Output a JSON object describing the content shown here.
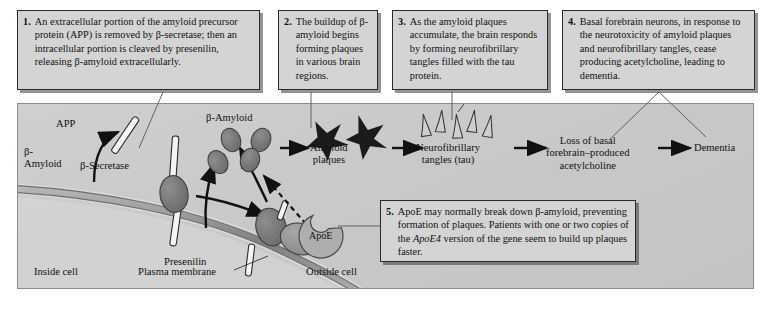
{
  "figure": {
    "background_color": "#c9c9c9",
    "box_fill": "#d4d4d4",
    "box_border": "#2a2a2a"
  },
  "callouts": [
    {
      "number": "1.",
      "text": "An extracellular portion of the amyloid precursor protein (APP) is removed by β-secretase; then an intracellular portion is cleaved by presenilin, releasing β-amyloid extracellularly."
    },
    {
      "number": "2.",
      "text": "The buildup of β-amyloid begins forming plaques in various brain regions."
    },
    {
      "number": "3.",
      "text": "As the amyloid plaques accumulate, the brain responds by forming neurofibrillary tangles filled with the tau protein."
    },
    {
      "number": "4.",
      "text": "Basal forebrain neurons, in response to the neurotoxicity of amyloid plaques and neurofibrillary tangles, cease producing acetylcholine, leading to dementia."
    },
    {
      "number": "5.",
      "text_part1": "ApoE may normally break down β-amyloid, preventing formation of plaques. Patients with one or two copies of the ",
      "italic": "ApoE4",
      "text_part2": " version of the gene seem to build up plaques faster."
    }
  ],
  "diagram_labels": {
    "app": "APP",
    "beta_amyloid_membrane": "β-\nAmyloid",
    "beta_amyloid_membrane_line1": "β-",
    "beta_amyloid_membrane_line2": "Amyloid",
    "beta_secretase": "β-Secretase",
    "beta_amyloid_cluster": "β-Amyloid",
    "presenilin": "Presenilin",
    "apoe": "ApoE",
    "inside_cell": "Inside cell",
    "plasma_membrane": "Plasma membrane",
    "outside_cell": "Outside cell"
  },
  "pathway": {
    "steps": [
      {
        "line1": "Amyloid",
        "line2": "plaques"
      },
      {
        "line1": "Neurofibrillary",
        "line2": "tangles (tau)"
      },
      {
        "line1": "Loss of basal",
        "line2": "forebrain–produced",
        "line3": "acetylcholine"
      },
      {
        "line1": "Dementia",
        "line2": "",
        "line3": ""
      }
    ]
  }
}
